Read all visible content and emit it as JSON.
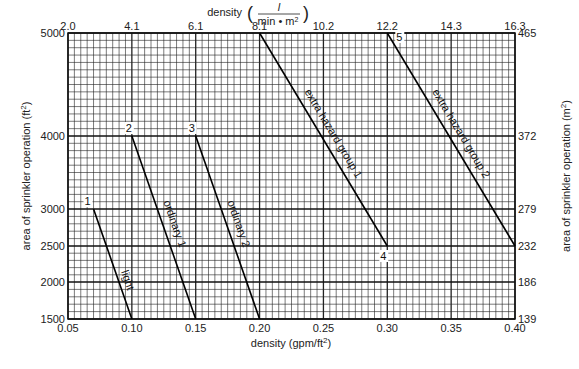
{
  "chart_data": {
    "type": "line",
    "title": "",
    "xlabel": "density (gpm/ft²)",
    "x2label": "density (L/min·m²)",
    "ylabel": "area of sprinkler operation (ft²)",
    "y2label": "area of sprinkler operation (m²)",
    "xlim": [
      0.05,
      0.4
    ],
    "ylim": [
      1500,
      5000
    ],
    "x_ticks": [
      "0.05",
      "0.10",
      "0.15",
      "0.20",
      "0.25",
      "0.30",
      "0.35",
      "0.40"
    ],
    "x2_ticks": [
      "2.0",
      "4.1",
      "6.1",
      "8.1",
      "10.2",
      "12.2",
      "14.3",
      "16.3"
    ],
    "y_ticks": [
      "5000",
      "4000",
      "3000",
      "2500",
      "2000",
      "1500"
    ],
    "y2_ticks": [
      "465",
      "372",
      "279",
      "232",
      "186",
      "139"
    ],
    "grid": true,
    "series": [
      {
        "name": "light",
        "point_label": "1",
        "x": [
          0.07,
          0.1
        ],
        "y": [
          3000,
          1500
        ]
      },
      {
        "name": "ordinary 1",
        "point_label": "2",
        "x": [
          0.1,
          0.15
        ],
        "y": [
          4000,
          1500
        ]
      },
      {
        "name": "ordinary 2",
        "point_label": "3",
        "x": [
          0.15,
          0.2
        ],
        "y": [
          4000,
          1500
        ]
      },
      {
        "name": "extra hazard group 1",
        "point_label": "4",
        "x": [
          0.2,
          0.3
        ],
        "y": [
          5000,
          2500
        ]
      },
      {
        "name": "extra hazard group 2",
        "point_label": "5",
        "x": [
          0.3,
          0.4
        ],
        "y": [
          5000,
          2500
        ]
      }
    ]
  },
  "labels": {
    "x_axis": "density (gpm/ft",
    "x_axis_sup": "2",
    "x_axis_close": ")",
    "x2_axis_prefix": "density",
    "x2_axis_num": "l",
    "x2_axis_den": "min • m",
    "x2_axis_den_sup": "2",
    "y_axis": "area of sprinkler operation (ft",
    "y_axis_sup": "2",
    "y_axis_close": ")",
    "y2_axis": "area of sprinkler operation (m",
    "y2_axis_sup": "2",
    "y2_axis_close": ")"
  }
}
